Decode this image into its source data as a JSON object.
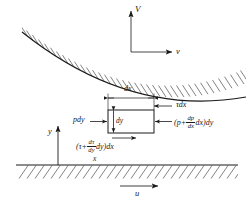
{
  "figure": {
    "type": "fluid-element-force-balance-diagram",
    "background_color": "#ffffff",
    "line_color": "#1a1a1a"
  },
  "labels": {
    "velocity_V": "V",
    "velocity_v": "v",
    "axis_y": "y",
    "axis_x": "x",
    "velocity_u": "u",
    "width_dx": "dx",
    "height_dy": "dy",
    "pressure_left": "pdy",
    "shear_top": "τdx"
  },
  "equations": {
    "pressure_right": {
      "prefix": "(p+",
      "frac_num": "dp",
      "frac_den": "dx",
      "mid": "dx)dy"
    },
    "shear_bottom": {
      "prefix": "(τ+",
      "frac_num": "dτ",
      "frac_den": "dy",
      "mid": "dy)dx"
    }
  },
  "geometry": {
    "upper_surface": {
      "shape": "concave-curve",
      "hatching_side": "above",
      "start": [
        22,
        32
      ],
      "control": [
        130,
        118
      ],
      "end": [
        246,
        97
      ]
    },
    "lower_wall": {
      "shape": "horizontal-line",
      "hatching_side": "below",
      "y": 165,
      "x_start": 16,
      "x_end": 238
    },
    "element_box": {
      "x": 108,
      "y": 110,
      "width": 46,
      "height": 23
    },
    "axis_origin": [
      58,
      165
    ]
  }
}
